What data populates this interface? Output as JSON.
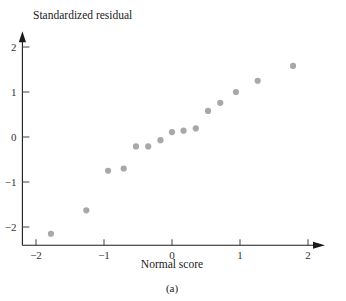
{
  "figure": {
    "caption": "(a)",
    "y_axis_title": "Standardized residual",
    "x_axis_title": "Normal score"
  },
  "colors": {
    "point": "#a8a8a8",
    "axis": "#1a1a1a",
    "tick": "#4a4a4a",
    "text": "#1a1a1a",
    "background": "#ffffff"
  },
  "chart_data": {
    "type": "scatter",
    "title": "",
    "subtitle": "(a)",
    "xlabel": "Normal score",
    "ylabel": "Standardized residual",
    "xlim": [
      -2.2,
      2.25
    ],
    "ylim": [
      -2.45,
      2.35
    ],
    "xticks": [
      -2,
      -1,
      0,
      1,
      2
    ],
    "xtick_labels": [
      "−2",
      "−1",
      "0",
      "1",
      "2"
    ],
    "yticks": [
      -2,
      -1,
      0,
      1,
      2
    ],
    "ytick_labels": [
      "−2",
      "−1",
      "0",
      "1",
      "2"
    ],
    "grid": false,
    "legend": null,
    "marker": "circle",
    "marker_color": "#a8a8a8",
    "marker_size": 3.1,
    "n_points": 15,
    "x": [
      -1.78,
      -1.26,
      -0.94,
      -0.71,
      -0.53,
      -0.35,
      -0.17,
      0.0,
      0.17,
      0.35,
      0.53,
      0.71,
      0.94,
      1.26,
      1.78
    ],
    "y": [
      -2.15,
      -1.63,
      -0.75,
      -0.7,
      -0.21,
      -0.21,
      -0.07,
      0.11,
      0.14,
      0.19,
      0.58,
      0.76,
      1.0,
      1.25,
      1.58
    ],
    "points": [
      {
        "x": -1.78,
        "y": -2.15
      },
      {
        "x": -1.26,
        "y": -1.63
      },
      {
        "x": -0.94,
        "y": -0.75
      },
      {
        "x": -0.71,
        "y": -0.7
      },
      {
        "x": -0.53,
        "y": -0.21
      },
      {
        "x": -0.35,
        "y": -0.21
      },
      {
        "x": -0.17,
        "y": -0.07
      },
      {
        "x": 0.0,
        "y": 0.11
      },
      {
        "x": 0.17,
        "y": 0.14
      },
      {
        "x": 0.35,
        "y": 0.19
      },
      {
        "x": 0.53,
        "y": 0.58
      },
      {
        "x": 0.71,
        "y": 0.76
      },
      {
        "x": 0.94,
        "y": 1.0
      },
      {
        "x": 1.26,
        "y": 1.25
      },
      {
        "x": 1.78,
        "y": 1.58
      }
    ]
  }
}
